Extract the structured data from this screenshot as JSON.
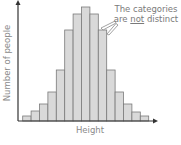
{
  "chart_data": {
    "type": "bar",
    "title": "",
    "xlabel": "Height",
    "ylabel": "Number of people",
    "categories": [
      "1",
      "2",
      "3",
      "4",
      "5",
      "6",
      "7",
      "8",
      "9",
      "10",
      "11",
      "12",
      "13",
      "14",
      "15"
    ],
    "values": [
      5,
      10,
      17,
      29,
      51,
      91,
      107,
      114,
      107,
      91,
      51,
      29,
      17,
      9,
      5
    ],
    "ylim": [
      0,
      120
    ],
    "grid": false,
    "legend": null,
    "bar_gap": 0,
    "annotations": [
      {
        "text_line1": "The categories",
        "text_line2_pre": "are ",
        "text_line2_emph": "not",
        "text_line2_post": " distinct",
        "points_to": "boundaries between bars 9-10"
      }
    ],
    "colors": {
      "bar_fill": "#d9d9d9",
      "bar_stroke": "#7a7a7a",
      "axis": "#333333",
      "text": "#8a8a8a"
    }
  },
  "labels": {
    "x": "Height",
    "y": "Number of people",
    "note_line1": "The categories",
    "note_pre": "are ",
    "note_emph": "not",
    "note_post": " distinct"
  }
}
